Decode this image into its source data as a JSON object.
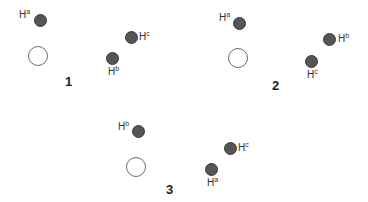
{
  "diagram": {
    "type": "molecular configurations",
    "panels": [
      {
        "number": "1",
        "center": {
          "x": 38,
          "y": 56
        },
        "number_pos": {
          "x": 65,
          "y": 74
        },
        "atoms": [
          {
            "label": "H",
            "sup": "a",
            "x": 39,
            "y": 19,
            "label_x": 19,
            "label_y": 10
          },
          {
            "label": "H",
            "sup": "c",
            "x": 130,
            "y": 36,
            "label_x": 139,
            "label_y": 32
          },
          {
            "label": "H",
            "sup": "b",
            "x": 111,
            "y": 57,
            "label_x": 108,
            "label_y": 67
          }
        ]
      },
      {
        "number": "2",
        "center": {
          "x": 238,
          "y": 58
        },
        "number_pos": {
          "x": 272,
          "y": 78
        },
        "atoms": [
          {
            "label": "H",
            "sup": "a",
            "x": 238,
            "y": 22,
            "label_x": 219,
            "label_y": 13
          },
          {
            "label": "H",
            "sup": "b",
            "x": 328,
            "y": 38,
            "label_x": 338,
            "label_y": 34
          },
          {
            "label": "H",
            "sup": "c",
            "x": 310,
            "y": 60,
            "label_x": 307,
            "label_y": 70
          }
        ]
      },
      {
        "number": "3",
        "center": {
          "x": 136,
          "y": 167
        },
        "number_pos": {
          "x": 166,
          "y": 182
        },
        "atoms": [
          {
            "label": "H",
            "sup": "b",
            "x": 137,
            "y": 130,
            "label_x": 118,
            "label_y": 122
          },
          {
            "label": "H",
            "sup": "c",
            "x": 229,
            "y": 147,
            "label_x": 238,
            "label_y": 143
          },
          {
            "label": "H",
            "sup": "a",
            "x": 210,
            "y": 168,
            "label_x": 207,
            "label_y": 178
          }
        ]
      }
    ]
  }
}
